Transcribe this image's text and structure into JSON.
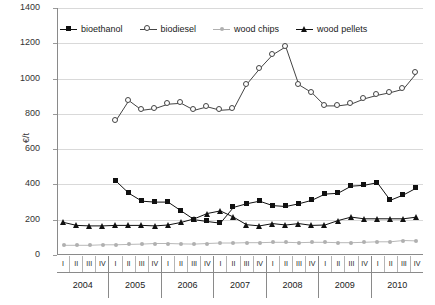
{
  "chart_data": {
    "type": "line",
    "title": "",
    "xlabel": "",
    "ylabel": "€/t",
    "ylim": [
      0,
      1400
    ],
    "ytick_step": 200,
    "yticks": [
      "1400",
      "1200",
      "1000",
      "800",
      "600",
      "400",
      "200",
      "0"
    ],
    "grid": true,
    "legend_position": "top-inside",
    "quarters": [
      "I",
      "II",
      "III",
      "IV"
    ],
    "years": [
      "2004",
      "2005",
      "2006",
      "2007",
      "2008",
      "2009",
      "2010"
    ],
    "x": [
      "2004-I",
      "2004-II",
      "2004-III",
      "2004-IV",
      "2005-I",
      "2005-II",
      "2005-III",
      "2005-IV",
      "2006-I",
      "2006-II",
      "2006-III",
      "2006-IV",
      "2007-I",
      "2007-II",
      "2007-III",
      "2007-IV",
      "2008-I",
      "2008-II",
      "2008-III",
      "2008-IV",
      "2009-I",
      "2009-II",
      "2009-III",
      "2009-IV",
      "2010-I",
      "2010-II",
      "2010-III",
      "2010-IV"
    ],
    "series": [
      {
        "name": "bioethanol",
        "marker": "filled-square",
        "color": "#111111",
        "values": [
          null,
          null,
          null,
          null,
          420,
          350,
          305,
          300,
          300,
          250,
          200,
          190,
          180,
          270,
          290,
          305,
          280,
          275,
          290,
          310,
          345,
          350,
          390,
          395,
          410,
          310,
          340,
          380
        ]
      },
      {
        "name": "biodiesel",
        "marker": "open-circle",
        "color": "#444444",
        "values": [
          null,
          null,
          null,
          null,
          760,
          875,
          820,
          830,
          855,
          860,
          820,
          840,
          820,
          825,
          965,
          1055,
          1135,
          1180,
          965,
          920,
          845,
          845,
          855,
          885,
          905,
          920,
          940,
          1030
        ]
      },
      {
        "name": "wood chips",
        "marker": "small-dot",
        "color": "#b0b0b0",
        "values": [
          55,
          55,
          55,
          58,
          58,
          60,
          62,
          65,
          65,
          63,
          62,
          65,
          68,
          68,
          70,
          70,
          72,
          72,
          70,
          72,
          72,
          70,
          70,
          72,
          75,
          75,
          82,
          80
        ]
      },
      {
        "name": "wood pellets",
        "marker": "filled-triangle",
        "color": "#111111",
        "values": [
          185,
          168,
          165,
          165,
          168,
          168,
          168,
          165,
          170,
          185,
          205,
          235,
          250,
          215,
          172,
          165,
          178,
          170,
          178,
          168,
          170,
          195,
          215,
          205,
          205,
          205,
          205,
          215
        ]
      }
    ]
  }
}
